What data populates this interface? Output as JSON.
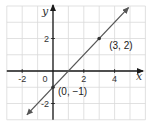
{
  "chart_data": {
    "type": "line",
    "title": "",
    "xlabel": "x",
    "ylabel": "y",
    "xlim": [
      -3,
      6
    ],
    "ylim": [
      -3,
      4
    ],
    "grid": true,
    "x_ticks": [
      {
        "value": -2,
        "label": "-2"
      },
      {
        "value": 0,
        "label": "0"
      },
      {
        "value": 2,
        "label": "2"
      },
      {
        "value": 4,
        "label": "4"
      }
    ],
    "y_ticks": [
      {
        "value": 2,
        "label": "2"
      },
      {
        "value": -2,
        "label": "-2"
      }
    ],
    "series": [
      {
        "name": "y = x - 1",
        "equation": "y = x - 1",
        "slope": 1,
        "intercept": -1,
        "x": [
          -1.7,
          4.9
        ],
        "y": [
          -2.7,
          3.9
        ],
        "arrows_both_ends": true,
        "color": "#555555"
      }
    ],
    "points": [
      {
        "x": 0,
        "y": -1,
        "label": "(0, −1)"
      },
      {
        "x": 3,
        "y": 2,
        "label": "(3, 2)"
      }
    ],
    "colors": {
      "grid": "#d9d9d9",
      "axis": "#1a1a1a",
      "line": "#555555",
      "point": "#333333"
    }
  }
}
